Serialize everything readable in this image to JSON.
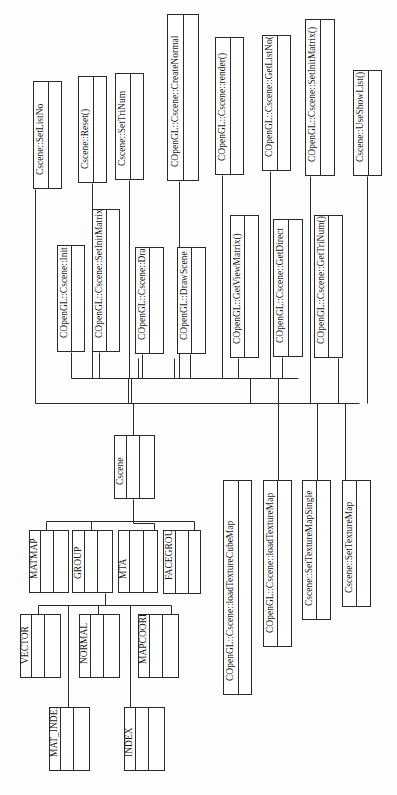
{
  "diagram": {
    "title": "",
    "orientation": "rotated-90-ccw",
    "colors": {
      "line": "#2a2a2a",
      "box_fill": "#ffffff",
      "text": "#1a1a1a",
      "background": "#fdfdfd"
    },
    "root": {
      "id": "cscene",
      "label": "Cscene",
      "x": 114,
      "y": 435,
      "w": 41,
      "h": 64,
      "cols": [
        12,
        13,
        14
      ]
    },
    "methods_top": [
      {
        "id": "set-list-no",
        "label": "Cscene::SetListNo",
        "x": 33,
        "y": 81,
        "w": 29,
        "h": 108,
        "cols": [
          15
        ]
      },
      {
        "id": "reset",
        "label": "Cscene::Reset()",
        "x": 78,
        "y": 76,
        "w": 29,
        "h": 107,
        "cols": [
          15
        ]
      },
      {
        "id": "set-tri-num",
        "label": "Cscene::SetTriNum",
        "x": 115,
        "y": 73,
        "w": 29,
        "h": 107,
        "cols": [
          15
        ]
      },
      {
        "id": "create-normal",
        "label": "COpenGL::Cscene::CreateNormal",
        "x": 167,
        "y": 14,
        "w": 32,
        "h": 167,
        "cols": [
          16
        ]
      },
      {
        "id": "render",
        "label": "COpenGL::Cscene::render()",
        "x": 215,
        "y": 37,
        "w": 29,
        "h": 138,
        "cols": [
          15
        ]
      },
      {
        "id": "get-list-no",
        "label": "COpenGL::Cscene::GetListNo()",
        "x": 262,
        "y": 35,
        "w": 29,
        "h": 136,
        "cols": [
          15
        ]
      },
      {
        "id": "set-init-matrix-top",
        "label": "COpenGL::Cscene::SetInitMatrix()",
        "x": 305,
        "y": 19,
        "w": 30,
        "h": 157,
        "cols": [
          15
        ]
      },
      {
        "id": "use-show-list",
        "label": "Cscene::UseShowList()",
        "x": 353,
        "y": 70,
        "w": 29,
        "h": 106,
        "cols": [
          15
        ]
      }
    ],
    "methods_mid": [
      {
        "id": "init",
        "label": "COpenGL::Cscene::Init",
        "x": 57,
        "y": 245,
        "w": 28,
        "h": 107,
        "cols": [
          14
        ]
      },
      {
        "id": "set-init-matrix",
        "label": "COpenGL::Cscene::SetInitMatrix",
        "x": 92,
        "y": 209,
        "w": 28,
        "h": 143,
        "cols": [
          14
        ]
      },
      {
        "id": "draw",
        "label": "COpenGL::Cscene::Draw",
        "x": 135,
        "y": 247,
        "w": 29,
        "h": 107,
        "cols": [
          14
        ]
      },
      {
        "id": "draw-scene",
        "label": "COpenGL::DrawScene",
        "x": 177,
        "y": 247,
        "w": 29,
        "h": 107,
        "cols": [
          14
        ]
      },
      {
        "id": "get-view-matrix",
        "label": "COpenGL::GetViewMatrix()",
        "x": 230,
        "y": 215,
        "w": 29,
        "h": 143,
        "cols": [
          14
        ]
      },
      {
        "id": "get-direct",
        "label": "COpenGL::Cscene::GetDirect",
        "x": 273,
        "y": 219,
        "w": 30,
        "h": 138,
        "cols": [
          15
        ]
      },
      {
        "id": "get-tri-num",
        "label": "COpenGL::Cscene::GetTriNum()",
        "x": 314,
        "y": 215,
        "w": 29,
        "h": 143,
        "cols": [
          14
        ]
      }
    ],
    "methods_bottom": [
      {
        "id": "load-texture-cube-map",
        "label": "COpenGL::Cscene::loadTextureCubeMap",
        "x": 223,
        "y": 480,
        "w": 29,
        "h": 215,
        "cols": [
          15
        ]
      },
      {
        "id": "load-texture-map",
        "label": "COpenGL::Cscene::loadTextureMap",
        "x": 263,
        "y": 480,
        "w": 29,
        "h": 167,
        "cols": [
          14
        ]
      },
      {
        "id": "set-texture-map-single",
        "label": "Cscene::SetTextureMapSingle",
        "x": 302,
        "y": 480,
        "w": 29,
        "h": 140,
        "cols": [
          14
        ]
      },
      {
        "id": "set-texture-map",
        "label": "Cscene::SetTextureMap",
        "x": 342,
        "y": 480,
        "w": 29,
        "h": 127,
        "cols": [
          14
        ]
      }
    ],
    "structs_level1": [
      {
        "id": "matmap",
        "label": "MATMAP",
        "x": 29,
        "y": 530,
        "w": 40,
        "h": 63,
        "cols": [
          11,
          13,
          14
        ]
      },
      {
        "id": "group",
        "label": "GROUP",
        "x": 72,
        "y": 530,
        "w": 41,
        "h": 63,
        "cols": [
          12,
          13,
          14
        ]
      },
      {
        "id": "mta",
        "label": "MTA",
        "x": 118,
        "y": 530,
        "w": 40,
        "h": 63,
        "cols": [
          11,
          14,
          13
        ]
      },
      {
        "id": "facegroup",
        "label": "FACEGROUP",
        "x": 163,
        "y": 530,
        "w": 38,
        "h": 64,
        "cols": [
          12,
          13,
          12
        ]
      }
    ],
    "structs_level2": [
      {
        "id": "vector",
        "label": "VECTOR",
        "x": 20,
        "y": 614,
        "w": 41,
        "h": 64,
        "cols": [
          11,
          13,
          15
        ]
      },
      {
        "id": "normal",
        "label": "NORMAL",
        "x": 79,
        "y": 614,
        "w": 41,
        "h": 64,
        "cols": [
          11,
          13,
          15
        ]
      },
      {
        "id": "mapcoord",
        "label": "MAPCOORD",
        "x": 138,
        "y": 614,
        "w": 41,
        "h": 64,
        "cols": [
          11,
          13,
          15
        ]
      }
    ],
    "structs_level3": [
      {
        "id": "mat-index",
        "label": "MAT_INDEX",
        "x": 49,
        "y": 707,
        "w": 41,
        "h": 64,
        "cols": [
          11,
          13,
          15
        ]
      },
      {
        "id": "index",
        "label": "INDEX",
        "x": 124,
        "y": 707,
        "w": 41,
        "h": 64,
        "cols": [
          11,
          13,
          15
        ]
      }
    ],
    "connectors": [
      [
        35,
        189,
        35,
        403
      ],
      [
        35,
        403,
        359,
        403
      ],
      [
        92,
        183,
        92,
        378
      ],
      [
        129,
        180,
        129,
        378
      ],
      [
        179,
        181,
        179,
        378
      ],
      [
        222,
        175,
        222,
        378
      ],
      [
        270,
        171,
        270,
        378
      ],
      [
        310,
        176,
        310,
        403
      ],
      [
        367,
        176,
        367,
        403
      ],
      [
        71,
        352,
        71,
        378
      ],
      [
        99,
        352,
        99,
        378
      ],
      [
        142,
        354,
        142,
        378
      ],
      [
        190,
        354,
        190,
        378
      ],
      [
        238,
        358,
        238,
        378
      ],
      [
        282,
        357,
        282,
        378
      ],
      [
        71,
        378,
        298,
        378
      ],
      [
        128,
        378,
        128,
        403
      ],
      [
        131,
        378,
        131,
        403
      ],
      [
        250,
        378,
        250,
        403
      ],
      [
        278,
        378,
        278,
        403
      ],
      [
        138,
        358,
        138,
        378
      ],
      [
        174,
        358,
        174,
        378
      ],
      [
        338,
        358,
        338,
        403
      ],
      [
        133,
        403,
        133,
        435
      ],
      [
        133,
        499,
        133,
        521
      ],
      [
        46,
        521,
        194,
        521
      ],
      [
        46,
        521,
        46,
        530
      ],
      [
        91,
        521,
        91,
        530
      ],
      [
        133,
        521,
        133,
        523
      ],
      [
        133,
        523,
        154,
        523
      ],
      [
        154,
        523,
        154,
        530
      ],
      [
        194,
        521,
        194,
        530
      ],
      [
        278,
        403,
        278,
        480
      ],
      [
        317,
        403,
        317,
        480
      ],
      [
        345,
        403,
        345,
        480
      ],
      [
        105,
        593,
        105,
        605
      ],
      [
        38,
        605,
        171,
        605
      ],
      [
        38,
        605,
        38,
        614
      ],
      [
        68,
        605,
        68,
        707
      ],
      [
        98,
        605,
        98,
        614
      ],
      [
        130,
        605,
        130,
        707
      ],
      [
        171,
        605,
        171,
        614
      ]
    ]
  }
}
